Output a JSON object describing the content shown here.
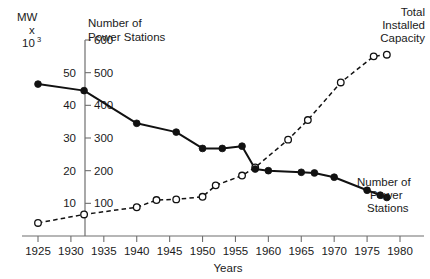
{
  "chart_data": {
    "type": "line",
    "title": "",
    "xlabel": "Years",
    "ylabel": "MW x 10³",
    "xlim": [
      1925,
      1980
    ],
    "ylim_left": [
      0,
      60
    ],
    "ylim_right": [
      0,
      600
    ],
    "grid": false,
    "legend_position": "in-plot annotations",
    "x_ticks": [
      1925,
      1930,
      1935,
      1940,
      1945,
      1950,
      1955,
      1960,
      1965,
      1970,
      1975,
      1980
    ],
    "y_ticks_left": [
      10,
      20,
      30,
      40,
      50
    ],
    "y_ticks_right": [
      100,
      200,
      300,
      400,
      500,
      600
    ],
    "annotations": [
      {
        "text": "Number of Power Stations",
        "position": "top-left"
      },
      {
        "text": "Total Installed Capacity",
        "position": "top-right"
      },
      {
        "text": "Number of Power Stations",
        "position": "bottom-right"
      }
    ],
    "series": [
      {
        "name": "Number of Power Stations",
        "style": "solid",
        "marker": "filled-circle",
        "axis": "right",
        "x": [
          1925,
          1932,
          1940,
          1946,
          1950,
          1953,
          1956,
          1958,
          1960,
          1965,
          1967,
          1970,
          1975,
          1977,
          1978
        ],
        "values": [
          465,
          445,
          345,
          318,
          268,
          268,
          275,
          205,
          200,
          195,
          193,
          180,
          140,
          125,
          118
        ]
      },
      {
        "name": "Total Installed Capacity",
        "style": "dashed",
        "marker": "open-circle",
        "axis": "left",
        "x": [
          1925,
          1932,
          1940,
          1943,
          1946,
          1950,
          1952,
          1956,
          1958,
          1963,
          1966,
          1971,
          1976,
          1978
        ],
        "values": [
          4.0,
          6.6,
          8.8,
          11.0,
          11.2,
          12.0,
          15.5,
          18.5,
          21.0,
          29.5,
          35.5,
          47.0,
          55.0,
          55.5
        ]
      }
    ]
  },
  "axes": {
    "left_unit_line1": "MW",
    "left_unit_line2": "x",
    "left_unit_line3": "10",
    "left_unit_exponent": "3",
    "x_axis_title": "Years"
  },
  "labels": {
    "top_left_line1": "Number of",
    "top_left_line2": "Power Stations",
    "top_right_line1": "Total",
    "top_right_line2": "Installed",
    "top_right_line3": "Capacity",
    "bottom_right_line1": "Number of",
    "bottom_right_line2": "Power",
    "bottom_right_line3": "Stations"
  },
  "colors": {
    "ink": "#111111",
    "axis": "#6f6f6f",
    "background": "#ffffff"
  }
}
